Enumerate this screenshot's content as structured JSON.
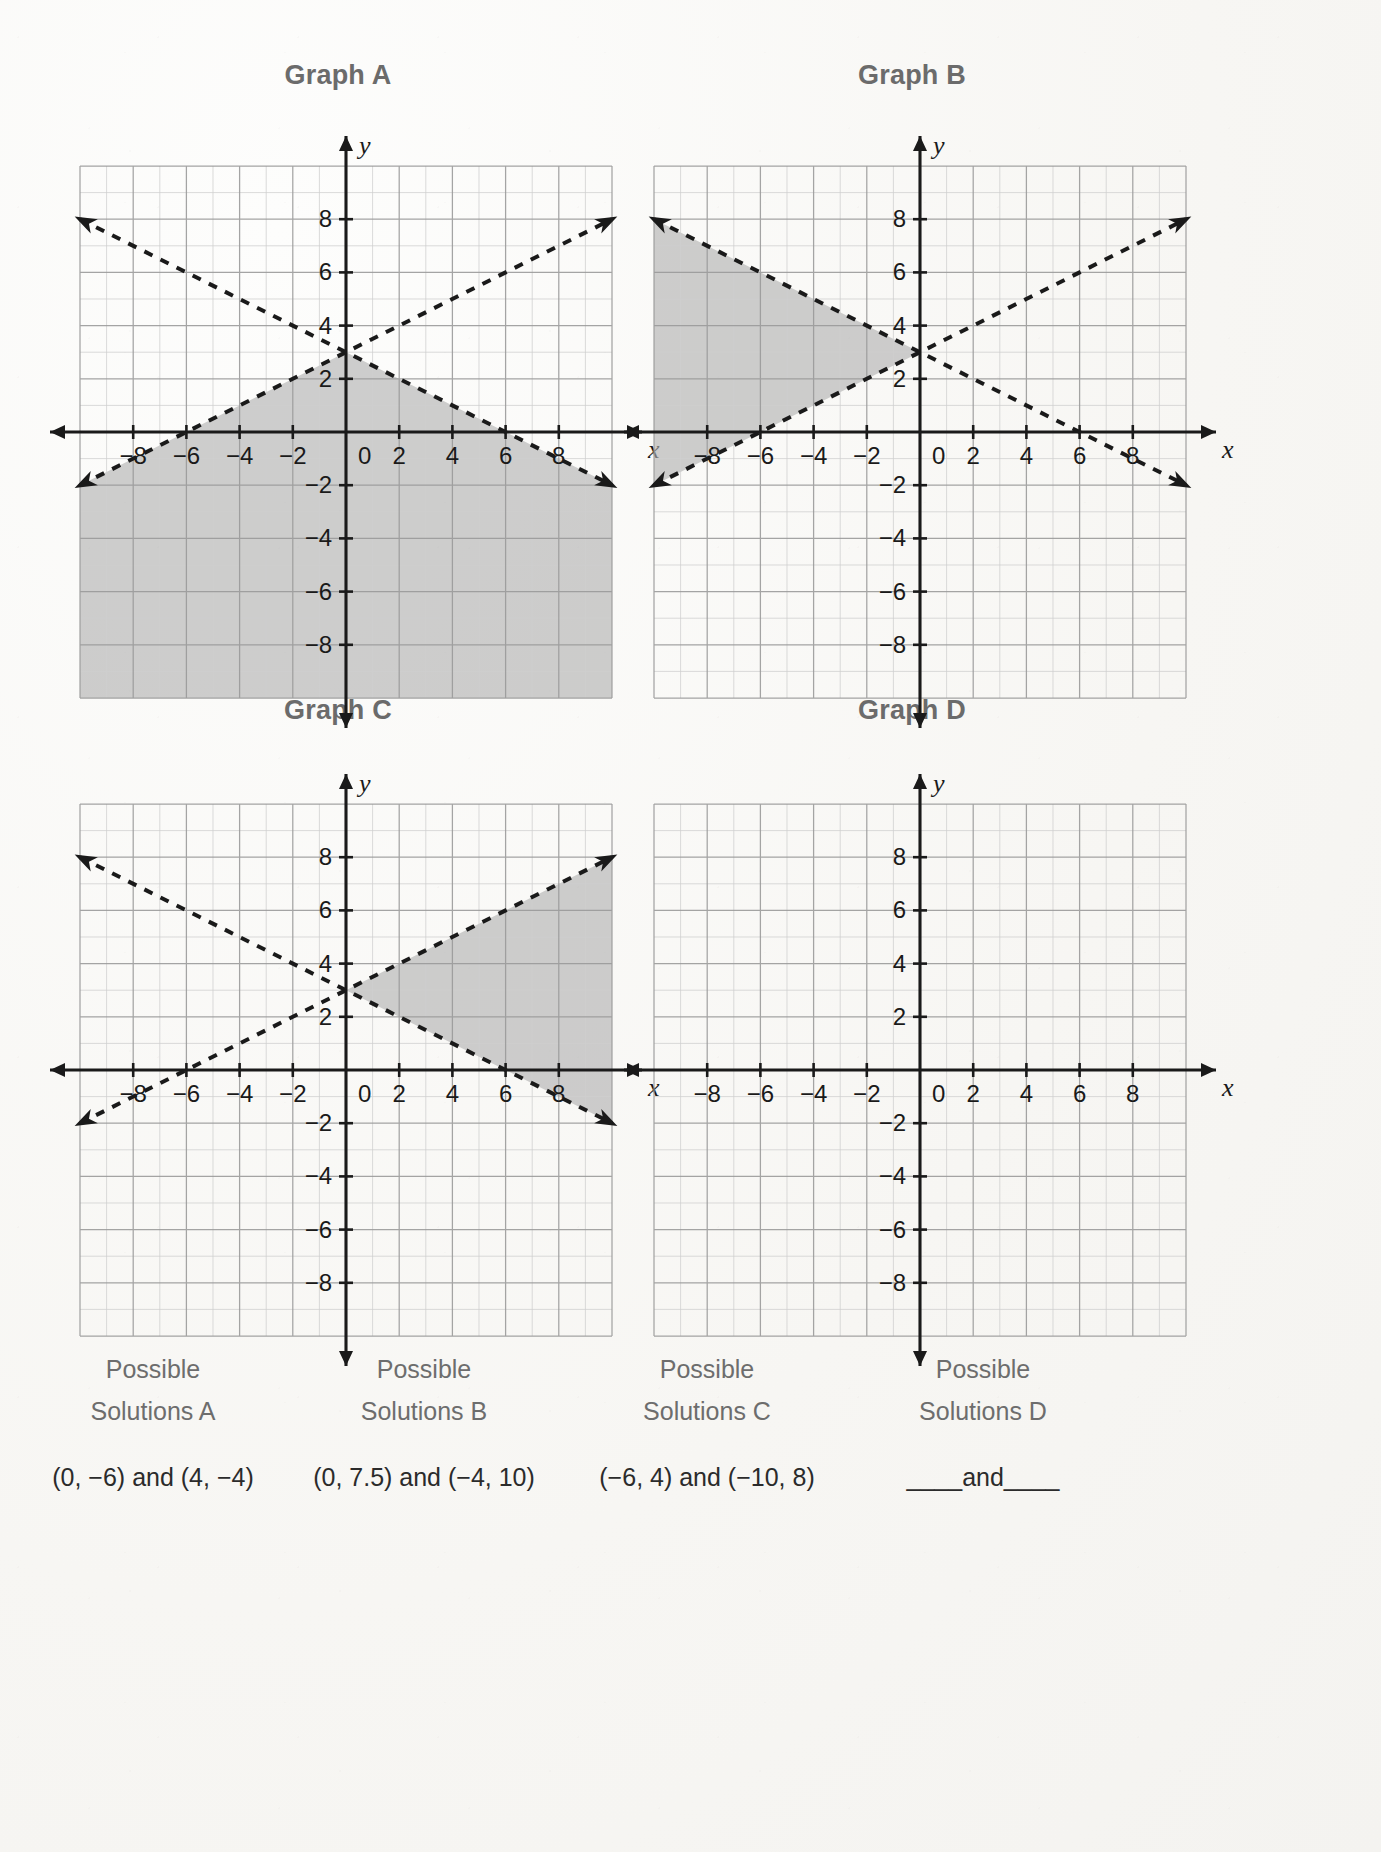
{
  "page": {
    "background_color": "#f7f6f3",
    "title_color": "#6b6b6b",
    "ink_color": "#1a1a1a",
    "shade_color": "#b0b0b0",
    "grid_minor_color": "#cfcfcf",
    "grid_major_color": "#9a9a9a"
  },
  "graphs": [
    {
      "title": "Graph A",
      "x_axis_label": "x",
      "y_axis_label": "y",
      "x_ticks": [
        "-8",
        "-6",
        "-4",
        "-2",
        "0",
        "2",
        "4",
        "6",
        "8"
      ],
      "y_ticks": [
        "8",
        "6",
        "4",
        "2",
        "-2",
        "-4",
        "-6",
        "-8"
      ],
      "origin_label": "0",
      "shading": "below-both-lines",
      "shading_present": true
    },
    {
      "title": "Graph B",
      "x_axis_label": "x",
      "y_axis_label": "y",
      "x_ticks": [
        "-8",
        "-6",
        "-4",
        "-2",
        "0",
        "2",
        "4",
        "6",
        "8"
      ],
      "y_ticks": [
        "8",
        "6",
        "4",
        "2",
        "-2",
        "-4",
        "-6",
        "-8"
      ],
      "origin_label": "0",
      "shading": "left-wedge",
      "shading_present": true
    },
    {
      "title": "Graph C",
      "x_axis_label": "x",
      "y_axis_label": "y",
      "x_ticks": [
        "-8",
        "-6",
        "-4",
        "-2",
        "0",
        "2",
        "4",
        "6",
        "8"
      ],
      "y_ticks": [
        "8",
        "6",
        "4",
        "2",
        "-2",
        "-4",
        "-6",
        "-8"
      ],
      "origin_label": "0",
      "shading": "right-wedge",
      "shading_present": true
    },
    {
      "title": "Graph D",
      "x_axis_label": "x",
      "y_axis_label": "y",
      "x_ticks": [
        "-8",
        "-6",
        "-4",
        "-2",
        "0",
        "2",
        "4",
        "6",
        "8"
      ],
      "y_ticks": [
        "8",
        "6",
        "4",
        "2",
        "-2",
        "-4",
        "-6",
        "-8"
      ],
      "origin_label": "0",
      "shading": "none",
      "shading_present": false
    }
  ],
  "captions": [
    {
      "label": "Possible\nSolutions A",
      "solutions": "(0, −6) and (4, −4)"
    },
    {
      "label": "Possible\nSolutions B",
      "solutions": "(0, 7.5) and (−4, 10)"
    },
    {
      "label": "Possible\nSolutions C",
      "solutions": "(−6, 4) and (−10, 8)"
    },
    {
      "label": "Possible\nSolutions D",
      "solutions": "____and____"
    }
  ],
  "chart_data": {
    "type": "line",
    "xlabel": "x",
    "ylabel": "y",
    "xlim": [
      -10,
      10
    ],
    "ylim": [
      -10,
      10
    ],
    "grid": true,
    "grid_step_minor": 1,
    "grid_step_major": 2,
    "tick_step": 2,
    "legend": "none",
    "intersection_point": [
      0,
      3
    ],
    "series": [
      {
        "name": "rising dashed boundary",
        "equation": "y = 0.5x + 3",
        "slope": 0.5,
        "intercept": 3,
        "style": "dashed",
        "arrows": "both",
        "x": [
          -10,
          10
        ],
        "y": [
          -2,
          8
        ]
      },
      {
        "name": "falling dashed boundary",
        "equation": "y = -0.5x + 3",
        "slope": -0.5,
        "intercept": 3,
        "style": "dashed",
        "arrows": "both",
        "x": [
          -10,
          10
        ],
        "y": [
          8,
          -2
        ]
      }
    ],
    "panels": [
      {
        "name": "Graph A",
        "shaded_region": "y < 0.5x + 3 AND y < -0.5x + 3",
        "description": "Region below both dashed lines (downward wedge from (0,3))"
      },
      {
        "name": "Graph B",
        "shaded_region": "y > 0.5x + 3 AND y < -0.5x + 3",
        "description": "Left wedge opening toward negative x from (0,3)"
      },
      {
        "name": "Graph C",
        "shaded_region": "y < 0.5x + 3 AND y > -0.5x + 3",
        "description": "Right wedge opening toward positive x from (0,3)"
      },
      {
        "name": "Graph D",
        "shaded_region": "none",
        "description": "Blank grid, no boundary lines or shading"
      }
    ]
  }
}
